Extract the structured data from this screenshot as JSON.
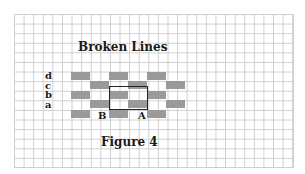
{
  "title": "Broken Lines",
  "caption": "Figure 4",
  "row_labels": [
    "d",
    "c",
    "b",
    "a"
  ],
  "point_labels": {
    "B": "B",
    "A": "A"
  },
  "colors": {
    "block": "#9a9a9a",
    "grid": "#cfcfcf",
    "outline": "#222222",
    "text": "#1a1a1a"
  },
  "pattern": {
    "rows": 5,
    "block_width_cells": 2,
    "description": "Alternating offset rows of gray bricks forming a staggered pattern; a black rectangle outlines a 4x2 cell region"
  }
}
